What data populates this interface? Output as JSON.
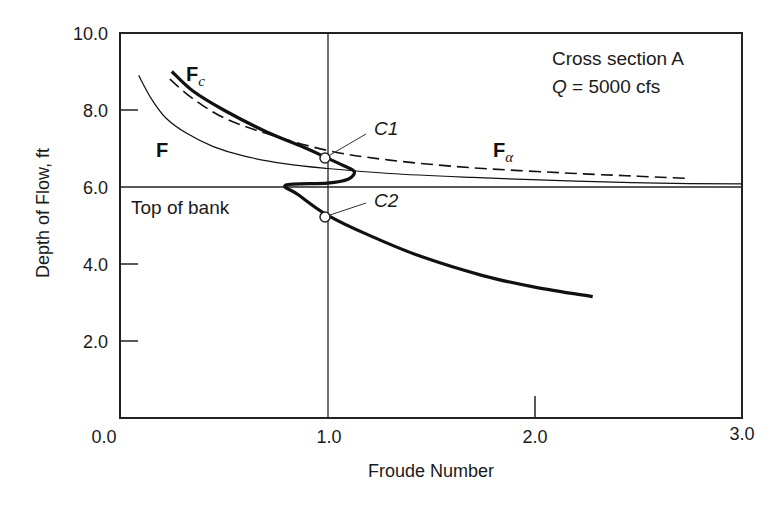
{
  "chart_data": {
    "type": "line",
    "title": "",
    "xlabel": "Froude Number",
    "ylabel": "Depth of Flow, ft",
    "xlim": [
      0.0,
      3.0
    ],
    "ylim": [
      0.0,
      10.0
    ],
    "x_ticks": [
      "0.0",
      "1.0",
      "2.0",
      "3.0"
    ],
    "y_ticks": [
      "0.0",
      "2.0",
      "4.0",
      "6.0",
      "8.0",
      "10.0"
    ],
    "grid": false,
    "annotations": {
      "cross_section": "Cross section A",
      "discharge_var": "Q",
      "discharge_value": " = 5000 cfs",
      "top_of_bank": "Top of bank",
      "top_of_bank_depth": 6.0,
      "critical_line_froude": 1.0,
      "c1_label": "C1",
      "c2_label": "C2"
    },
    "series": [
      {
        "name": "F",
        "label_main": "F",
        "label_sub": "",
        "style": "thin-solid",
        "points": [
          [
            0.09,
            8.9
          ],
          [
            0.15,
            8.3
          ],
          [
            0.22,
            7.8
          ],
          [
            0.32,
            7.4
          ],
          [
            0.45,
            7.05
          ],
          [
            0.6,
            6.8
          ],
          [
            0.8,
            6.6
          ],
          [
            1.0,
            6.48
          ],
          [
            1.3,
            6.35
          ],
          [
            1.7,
            6.25
          ],
          [
            2.2,
            6.15
          ],
          [
            2.6,
            6.1
          ],
          [
            3.0,
            6.08
          ]
        ]
      },
      {
        "name": "Fc",
        "label_main": "F",
        "label_sub": "c",
        "style": "thick-solid",
        "points": [
          [
            0.25,
            9.0
          ],
          [
            0.35,
            8.5
          ],
          [
            0.5,
            8.0
          ],
          [
            0.7,
            7.45
          ],
          [
            0.9,
            7.0
          ],
          [
            1.0,
            6.75
          ],
          [
            1.08,
            6.55
          ],
          [
            1.13,
            6.4
          ],
          [
            1.1,
            6.2
          ],
          [
            1.0,
            6.1
          ],
          [
            0.8,
            6.05
          ],
          [
            0.86,
            5.8
          ],
          [
            1.0,
            5.27
          ],
          [
            1.2,
            4.75
          ],
          [
            1.45,
            4.2
          ],
          [
            1.75,
            3.7
          ],
          [
            2.0,
            3.4
          ],
          [
            2.28,
            3.15
          ]
        ]
      },
      {
        "name": "Falpha",
        "label_main": "F",
        "label_sub": "α",
        "style": "dashed",
        "points": [
          [
            0.24,
            8.8
          ],
          [
            0.35,
            8.3
          ],
          [
            0.5,
            7.8
          ],
          [
            0.7,
            7.4
          ],
          [
            1.0,
            6.95
          ],
          [
            1.3,
            6.7
          ],
          [
            1.7,
            6.5
          ],
          [
            2.2,
            6.35
          ],
          [
            2.5,
            6.28
          ],
          [
            2.75,
            6.22
          ]
        ]
      }
    ],
    "critical_points": [
      {
        "name": "C1",
        "froude": 1.0,
        "depth": 6.75
      },
      {
        "name": "C2",
        "froude": 1.0,
        "depth": 5.27
      }
    ]
  }
}
